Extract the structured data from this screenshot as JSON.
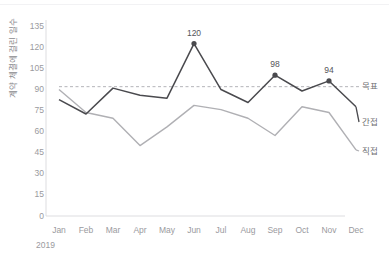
{
  "chart_data": {
    "type": "line",
    "title": "",
    "xlabel": "",
    "ylabel": "계약 체결에 걸린 일수",
    "x_period": "2019",
    "categories": [
      "Jan",
      "Feb",
      "Mar",
      "Apr",
      "May",
      "Jun",
      "Jul",
      "Aug",
      "Sep",
      "Oct",
      "Nov",
      "Dec"
    ],
    "ylim": [
      0,
      135
    ],
    "yticks": [
      0,
      15,
      30,
      45,
      60,
      75,
      90,
      105,
      120,
      135
    ],
    "grid": false,
    "legend_position": "right-inline",
    "series": [
      {
        "name": "목표",
        "type": "target-line",
        "style": "dashed",
        "color": "#b5b5ba",
        "constant_value": 90,
        "values": [
          90,
          90,
          90,
          90,
          90,
          90,
          90,
          90,
          90,
          90,
          90,
          90
        ]
      },
      {
        "name": "간접",
        "type": "line",
        "style": "solid",
        "color": "#4a4a4e",
        "values": [
          81,
          71,
          89,
          84,
          82,
          120,
          88,
          79,
          98,
          87,
          94,
          76
        ]
      },
      {
        "name": "직접",
        "type": "line",
        "style": "solid",
        "color": "#b0b0b4",
        "values": [
          88,
          72,
          68,
          49,
          62,
          77,
          74,
          68,
          56,
          76,
          72,
          46
        ]
      }
    ],
    "point_labels": [
      {
        "category": "Jun",
        "series": "간접",
        "value": 120,
        "text": "120"
      },
      {
        "category": "Sep",
        "series": "간접",
        "value": 98,
        "text": "98"
      },
      {
        "category": "Nov",
        "series": "간접",
        "value": 94,
        "text": "94"
      }
    ]
  },
  "axis": {
    "yticks": [
      "135",
      "120",
      "105",
      "90",
      "75",
      "60",
      "45",
      "30",
      "15",
      "0"
    ],
    "xticks": [
      "Jan",
      "Feb",
      "Mar",
      "Apr",
      "May",
      "Jun",
      "Jul",
      "Aug",
      "Sep",
      "Oct",
      "Nov",
      "Dec"
    ],
    "year": "2019",
    "ylabel": "계약 체결에 걸린 일수"
  },
  "legend": {
    "target": "목표",
    "indirect": "간접",
    "direct": "직접"
  },
  "labels": {
    "p1": "120",
    "p2": "98",
    "p3": "94"
  }
}
